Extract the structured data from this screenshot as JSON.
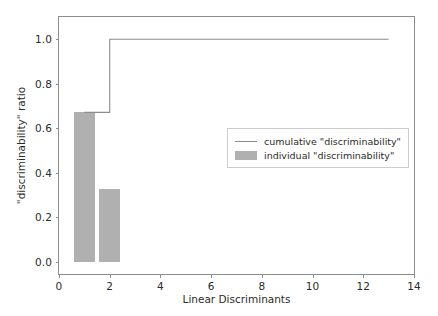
{
  "chart_data": {
    "type": "bar",
    "title": "",
    "subtitle": "",
    "xlabel": "Linear Discriminants",
    "ylabel": "\"discriminability\" ratio",
    "xlim": [
      0,
      14
    ],
    "ylim": [
      -0.055,
      1.1
    ],
    "xticks": [
      0,
      2,
      4,
      6,
      8,
      10,
      12,
      14
    ],
    "xticklabels": [
      "0",
      "2",
      "4",
      "6",
      "8",
      "10",
      "12",
      "14"
    ],
    "yticks": [
      0.0,
      0.2,
      0.4,
      0.6,
      0.8,
      1.0
    ],
    "yticklabels": [
      "0.0",
      "0.2",
      "0.4",
      "0.6",
      "0.8",
      "1.0"
    ],
    "grid": false,
    "legend_position": "center right",
    "series": [
      {
        "name": "individual \"discriminability\"",
        "type": "bar",
        "color": "#b0b0b0",
        "bar_width": 0.85,
        "categories": [
          1,
          2,
          3,
          4,
          5,
          6,
          7,
          8,
          9,
          10,
          11,
          12,
          13
        ],
        "values": [
          0.6712,
          0.3288,
          0.0,
          0.0,
          0.0,
          0.0,
          0.0,
          0.0,
          0.0,
          0.0,
          0.0,
          0.0,
          0.0
        ]
      },
      {
        "name": "cumulative \"discriminability\"",
        "type": "step",
        "color": "#8d8d8d",
        "x": [
          1,
          2,
          3,
          4,
          5,
          6,
          7,
          8,
          9,
          10,
          11,
          12,
          13
        ],
        "values": [
          0.6712,
          1.0,
          1.0,
          1.0,
          1.0,
          1.0,
          1.0,
          1.0,
          1.0,
          1.0,
          1.0,
          1.0,
          1.0
        ]
      }
    ]
  },
  "legend": {
    "entries": [
      {
        "label": "cumulative \"discriminability\"",
        "marker": "line"
      },
      {
        "label": "individual \"discriminability\"",
        "marker": "patch"
      }
    ]
  },
  "colors": {
    "bar": "#b0b0b0",
    "line": "#8d8d8d",
    "axis": "#8d8d8d",
    "text": "#2b2b2b",
    "background": "#ffffff",
    "legend_frame": "#cccccc"
  }
}
